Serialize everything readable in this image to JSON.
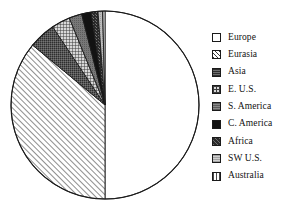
{
  "chart_data": {
    "type": "pie",
    "title": "",
    "start_angle_deg": 0,
    "direction": "clockwise",
    "legend_position": "right",
    "grid": false,
    "categories": [
      "Europe",
      "Eurasia",
      "Asia",
      "E. U.S.",
      "S. America",
      "C. America",
      "Africa",
      "SW U.S.",
      "Australia"
    ],
    "values": [
      50.0,
      36.0,
      4.6,
      3.2,
      2.2,
      1.6,
      1.2,
      0.8,
      0.4
    ],
    "units": "percent",
    "slices": [
      {
        "label": "Europe",
        "value": 50.0,
        "pattern": "solid-white",
        "fill": "#ffffff",
        "start_deg": 0.0,
        "end_deg": 180.0
      },
      {
        "label": "Eurasia",
        "value": 36.0,
        "pattern": "diagonal-hatch",
        "fill": "#ffffff",
        "start_deg": 180.0,
        "end_deg": 309.6
      },
      {
        "label": "Asia",
        "value": 4.6,
        "pattern": "dark-gray-solid",
        "fill": "#4d4d4d",
        "start_deg": 309.6,
        "end_deg": 326.2
      },
      {
        "label": "E. U.S.",
        "value": 3.2,
        "pattern": "crosshatch",
        "fill": "#8c8c8c",
        "start_deg": 326.2,
        "end_deg": 337.7
      },
      {
        "label": "S. America",
        "value": 2.2,
        "pattern": "medium-gray",
        "fill": "#6e6e6e",
        "start_deg": 337.7,
        "end_deg": 345.6
      },
      {
        "label": "C. America",
        "value": 1.6,
        "pattern": "solid-black",
        "fill": "#121212",
        "start_deg": 345.6,
        "end_deg": 351.4
      },
      {
        "label": "Africa",
        "value": 1.2,
        "pattern": "dark-speckle",
        "fill": "#333333",
        "start_deg": 351.4,
        "end_deg": 355.7
      },
      {
        "label": "SW U.S.",
        "value": 0.8,
        "pattern": "light-gray",
        "fill": "#b5b5b5",
        "start_deg": 355.7,
        "end_deg": 358.6
      },
      {
        "label": "Australia",
        "value": 0.4,
        "pattern": "vertical-stripe",
        "fill": "#ffffff",
        "start_deg": 358.6,
        "end_deg": 360.0
      }
    ]
  },
  "pie": {
    "center_x": 105,
    "center_y": 105,
    "radius": 94,
    "outline_color": "#1a1a1a"
  },
  "legend": {
    "items": [
      {
        "label": "Europe"
      },
      {
        "label": "Eurasia"
      },
      {
        "label": "Asia"
      },
      {
        "label": "E. U.S."
      },
      {
        "label": "S. America"
      },
      {
        "label": "C. America"
      },
      {
        "label": "Africa"
      },
      {
        "label": "SW U.S."
      },
      {
        "label": "Australia"
      }
    ]
  }
}
